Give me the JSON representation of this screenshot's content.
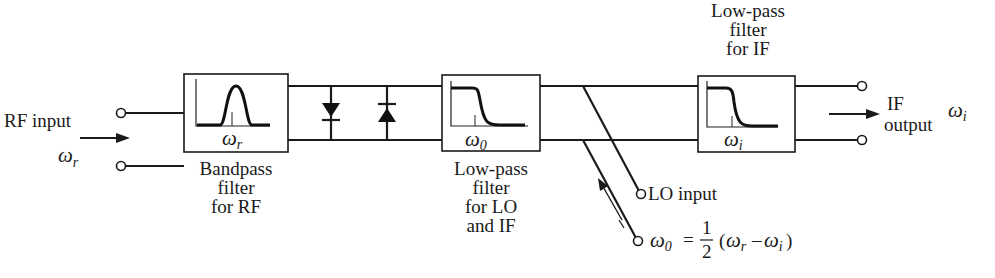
{
  "diagram": {
    "rf_input": {
      "label": "RF input",
      "symbol": "ω",
      "subscript": "r"
    },
    "bandpass_filter": {
      "caption": [
        "Bandpass",
        "filter",
        "for RF"
      ],
      "freq_symbol": "ω",
      "freq_subscript": "r"
    },
    "diodes": {
      "count": 2,
      "arrangement": "antiparallel"
    },
    "lo_if_filter": {
      "caption": [
        "Low-pass",
        "filter",
        "for LO",
        "and IF"
      ],
      "freq_symbol": "ω",
      "freq_subscript": "0"
    },
    "if_filter": {
      "caption": [
        "Low-pass",
        "filter",
        "for IF"
      ],
      "freq_symbol": "ω",
      "freq_subscript": "i"
    },
    "lo_input": {
      "label": "LO input",
      "equation": {
        "lhs_symbol": "ω",
        "lhs_subscript": "0",
        "equals": "=",
        "fraction_num": "1",
        "fraction_den": "2",
        "open": "(",
        "a_symbol": "ω",
        "a_subscript": "r",
        "minus": "–",
        "b_symbol": "ω",
        "b_subscript": "i",
        "close": ")"
      }
    },
    "if_output": {
      "label_line1": "IF",
      "label_line2": "output",
      "symbol": "ω",
      "subscript": "i"
    },
    "colors": {
      "line": "#1a1a1a",
      "background": "#ffffff"
    }
  }
}
